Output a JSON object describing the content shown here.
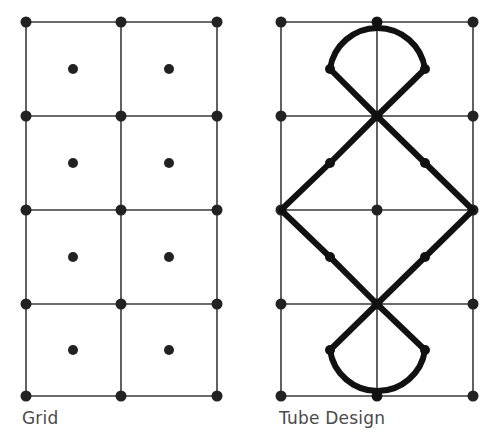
{
  "panels": [
    {
      "id": "grid",
      "caption": "Grid",
      "columns": [
        26,
        121,
        217
      ],
      "rows": [
        22,
        116,
        210,
        304,
        396
      ],
      "centers": [
        [
          73,
          69
        ],
        [
          169,
          69
        ],
        [
          73,
          163
        ],
        [
          169,
          163
        ],
        [
          73,
          257
        ],
        [
          169,
          257
        ],
        [
          73,
          350
        ],
        [
          169,
          350
        ]
      ]
    },
    {
      "id": "tube-design",
      "caption": "Tube Design",
      "columns": [
        281,
        377,
        473
      ],
      "rows": [
        22,
        116,
        210,
        304,
        396
      ],
      "centers": [
        [
          377,
          210
        ]
      ],
      "tube_path": "M 330 69 A 48 48 0 0 1 425 69 L 377 116 L 330 163 L 281 210 L 330 257 L 377 304 L 330 350 A 48 48 0 0 0 425 350 L 377 304 L 425 257 L 473 210 L 425 163 L 377 116 L 330 69 Z",
      "tube_nodes": [
        [
          330,
          69
        ],
        [
          425,
          69
        ],
        [
          330,
          163
        ],
        [
          425,
          163
        ],
        [
          330,
          257
        ],
        [
          425,
          257
        ],
        [
          330,
          350
        ],
        [
          425,
          350
        ],
        [
          377,
          22
        ],
        [
          377,
          396
        ]
      ]
    }
  ],
  "colors": {
    "line": "#3a3a3a",
    "dot": "#222222",
    "tube": "#111111",
    "caption": "#4a4a4a"
  }
}
